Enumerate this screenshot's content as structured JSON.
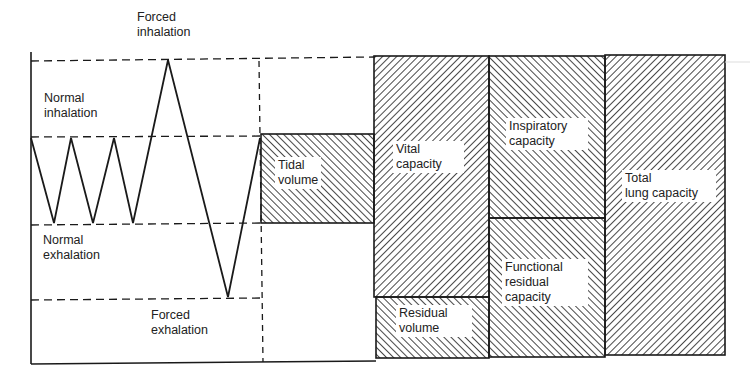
{
  "diagram": {
    "type": "spirogram-lung-volumes",
    "colors": {
      "line": "#1a1a1a",
      "background": "#ffffff",
      "hatch": "#1a1a1a"
    },
    "trace_labels": {
      "forced_inhalation": "Forced\ninhalation",
      "normal_inhalation": "Normal\ninhalation",
      "normal_exhalation": "Normal\nexhalation",
      "forced_exhalation": "Forced\nexhalation"
    },
    "volume_labels": {
      "tidal_volume": "Tidal\nvolume",
      "vital_capacity": "Vital\ncapacity",
      "residual_volume": "Residual\nvolume",
      "inspiratory_capacity": "Inspiratory\ncapacity",
      "functional_residual_capacity": "Functional\nresidual\ncapacity",
      "total_lung_capacity": "Total\nlung capacity"
    }
  }
}
